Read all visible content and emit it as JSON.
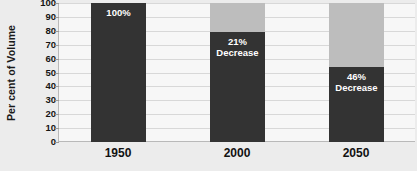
{
  "chart_data": {
    "type": "bar",
    "title": "",
    "xlabel": "",
    "ylabel": "Per cent of Volume",
    "categories": [
      "1950",
      "2000",
      "2050"
    ],
    "values": [
      100,
      79,
      54
    ],
    "ylim": [
      0,
      100
    ],
    "yticks": [
      0,
      10,
      20,
      30,
      40,
      50,
      60,
      70,
      80,
      90,
      100
    ],
    "ytick_labels": [
      "0",
      "10",
      "20",
      "30",
      "40",
      "50",
      "60",
      "70",
      "80",
      "90",
      "100"
    ],
    "grid": true,
    "legend": "none",
    "series": [
      {
        "name": "Per cent of Volume",
        "values": [
          100,
          79,
          54
        ]
      },
      {
        "name": "Decrease (ghost)",
        "values": [
          0,
          21,
          46
        ]
      }
    ],
    "bars": [
      {
        "category": "1950",
        "filled_percent": 100,
        "ghost_percent": 0,
        "label_line1": "100%",
        "label_line2": ""
      },
      {
        "category": "2000",
        "filled_percent": 79,
        "ghost_percent": 21,
        "label_line1": "21%",
        "label_line2": "Decrease"
      },
      {
        "category": "2050",
        "filled_percent": 54,
        "ghost_percent": 46,
        "label_line1": "46%",
        "label_line2": "Decrease"
      }
    ],
    "colors": {
      "bar_fill": "#333333",
      "bar_ghost": "#bdbdbd",
      "plot_background": "#f7f7f7",
      "figure_background": "#ececec",
      "gridline": "#d8d8d8",
      "axis_line": "#b9b9b9",
      "text": "#141414",
      "bar_label_text": "#ffffff"
    }
  }
}
